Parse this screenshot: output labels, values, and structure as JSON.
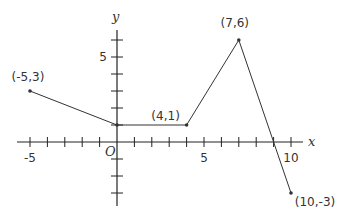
{
  "chart_data": {
    "type": "line",
    "title": "",
    "xlabel": "x",
    "ylabel": "y",
    "origin_label": "O",
    "xlim": [
      -5.5,
      10.5
    ],
    "ylim": [
      -4,
      6.5
    ],
    "x_ticks": [
      -5,
      -4,
      -3,
      -2,
      -1,
      1,
      2,
      3,
      4,
      5,
      6,
      7,
      8,
      9,
      10
    ],
    "y_ticks": [
      -3,
      -2,
      -1,
      1,
      2,
      3,
      4,
      5,
      6
    ],
    "x_tick_labels": [
      {
        "value": -5,
        "label": "-5"
      },
      {
        "value": 5,
        "label": "5"
      },
      {
        "value": 10,
        "label": "10"
      }
    ],
    "y_tick_labels": [
      {
        "value": 5,
        "label": "5"
      }
    ],
    "grid": false,
    "series": [
      {
        "name": "piecewise",
        "points": [
          {
            "x": -5,
            "y": 3,
            "label": "(-5,3)"
          },
          {
            "x": 0,
            "y": 1,
            "label": ""
          },
          {
            "x": 4,
            "y": 1,
            "label": "(4,1)"
          },
          {
            "x": 7,
            "y": 6,
            "label": "(7,6)"
          },
          {
            "x": 10,
            "y": -3,
            "label": "(10,-3)"
          }
        ]
      }
    ],
    "line_color": "#333333",
    "axis_color": "#222222"
  }
}
